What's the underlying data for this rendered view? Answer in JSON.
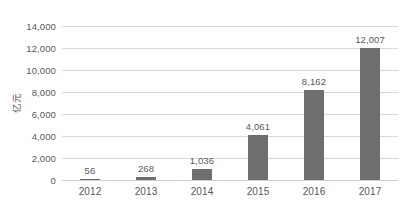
{
  "chart_data": {
    "type": "bar",
    "title": "",
    "subtitle": "",
    "xlabel": "",
    "ylabel": "亿元",
    "categories": [
      "2012",
      "2013",
      "2014",
      "2015",
      "2016",
      "2017"
    ],
    "values": [
      56,
      268,
      1036,
      4061,
      8162,
      12007
    ],
    "value_labels": [
      "56",
      "268",
      "1,036",
      "4,061",
      "8,162",
      "12,007"
    ],
    "series": [
      {
        "name": "",
        "values": [
          56,
          268,
          1036,
          4061,
          8162,
          12007
        ]
      }
    ],
    "ylim": [
      0,
      14000
    ],
    "ytick_values": [
      0,
      2000,
      4000,
      6000,
      8000,
      10000,
      12000,
      14000
    ],
    "ytick_labels": [
      "0",
      "2,000",
      "4,000",
      "6,000",
      "8,000",
      "10,000",
      "12,000",
      "14,000"
    ],
    "grid": true,
    "grid_axis": "y",
    "legend": false,
    "legend_position": "none",
    "bar_color": "#6e6e6e",
    "grid_color": "#d9d9d9",
    "text_color": "#595959",
    "background_color": "#ffffff",
    "data_labels_shown": true
  }
}
